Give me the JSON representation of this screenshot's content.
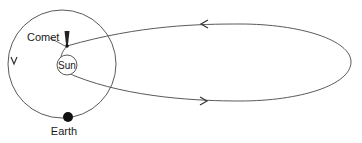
{
  "diagram": {
    "type": "orbital-diagram",
    "labels": {
      "comet": "Comet",
      "sun": "Sun",
      "earth": "Earth"
    },
    "colors": {
      "stroke": "#5a5a5a",
      "body": "#111111",
      "background": "#ffffff"
    },
    "elements": {
      "earth_orbit": {
        "shape": "circle",
        "direction": "counterclockwise-arrow-down-on-left"
      },
      "comet_orbit": {
        "shape": "ellipse",
        "top_arrow": "left",
        "bottom_arrow": "right"
      },
      "sun": {
        "shape": "small circle with label"
      },
      "comet": {
        "shape": "nucleus with tail pointing away from sun"
      },
      "earth": {
        "shape": "filled dot on orbit bottom"
      }
    }
  }
}
